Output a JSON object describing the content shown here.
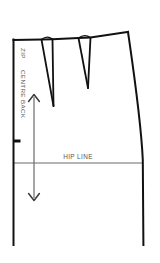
{
  "diagram": {
    "type": "sewing-pattern-technical-flat",
    "canvas": {
      "width": 160,
      "height": 263,
      "background": "#ffffff"
    },
    "colors": {
      "outline": "#111111",
      "guide": "#6b6b6b",
      "text": "#555555",
      "background": "#ffffff"
    },
    "labels": {
      "zip": "ZIP",
      "centre_back": "CENTRE BACK",
      "hip_line": "HIP LINE"
    },
    "label_placement": {
      "zip": {
        "x": 21,
        "y": 48,
        "rotation": 90,
        "font_size": 6.2
      },
      "centre_back": {
        "x": 21,
        "y": 70,
        "rotation": 90,
        "font_size": 6.2
      },
      "hip_line": {
        "x": 78,
        "y": 158,
        "rotation": 0,
        "font_size": 6.4,
        "anchor": "middle"
      }
    },
    "geometry": {
      "centre_back_line": {
        "x": 13.5,
        "y_top": 40,
        "y_bottom": 245
      },
      "side_seam_line": {
        "x_top": 128,
        "y_top": 32,
        "x_hip": 143,
        "y_hip": 163,
        "x_bottom": 143.5,
        "y_bottom": 245
      },
      "waist_left_point": {
        "x": 13.5,
        "y": 40
      },
      "waist_right_point": {
        "x": 128,
        "y": 32
      },
      "hip_line_segment": {
        "x1": 13.5,
        "x2": 143,
        "y": 163
      },
      "zip_stop_notch": {
        "x1": 13.5,
        "x2": 20,
        "y": 141
      },
      "grain_arrow": {
        "x": 34,
        "y_top": 95,
        "y_bottom": 200,
        "head_size": 6
      },
      "darts": [
        {
          "name": "dart-1",
          "waist_left": {
            "x": 41.5,
            "y": 39.6
          },
          "waist_right": {
            "x": 52.5,
            "y": 39.2
          },
          "apex": {
            "x": 53.5,
            "y": 106
          },
          "waist_bump_height": 3.2
        },
        {
          "name": "dart-2",
          "waist_left": {
            "x": 78.5,
            "y": 38.0
          },
          "waist_right": {
            "x": 90.5,
            "y": 37.6
          },
          "apex": {
            "x": 88.0,
            "y": 88
          },
          "waist_bump_height": 3.2
        }
      ]
    },
    "stroke_widths": {
      "outline": 2.0,
      "dart": 1.7,
      "guide": 1.0,
      "notch": 2.6
    }
  }
}
